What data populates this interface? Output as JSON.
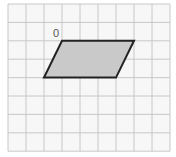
{
  "diagram": {
    "type": "grid-parallelogram",
    "grid": {
      "columns": 9,
      "rows": 8,
      "origin_x": 8,
      "origin_y": 4,
      "cell_width": 18,
      "cell_height": 18.4,
      "line_color": "#c8c8c8",
      "background": "#f7f7f7"
    },
    "shape": {
      "name": "parallelogram",
      "vertices_grid": [
        [
          3,
          2
        ],
        [
          7,
          2
        ],
        [
          6,
          4
        ],
        [
          2,
          4
        ]
      ],
      "fill": "#c9c9c9",
      "stroke": "#222222"
    },
    "labels": [
      {
        "text": "0",
        "at_vertex": 0
      }
    ]
  }
}
